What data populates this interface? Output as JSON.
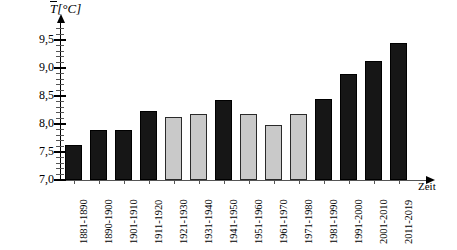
{
  "chart_data": {
    "type": "bar",
    "title": "",
    "ylabel": "T̄[°C]",
    "ylabel_symbol": "T",
    "ylabel_unit": "[°C]",
    "xlabel": "Zeit",
    "ylim": [
      7.0,
      9.75
    ],
    "ytick_values": [
      7.0,
      7.5,
      8.0,
      8.5,
      9.0,
      9.5
    ],
    "ytick_labels": [
      "7,0",
      "7,5",
      "8,0",
      "8,5",
      "9,0",
      "9,5"
    ],
    "ytick_minor_step": 0.1,
    "grid": false,
    "legend": "none",
    "categories": [
      "1881-1890",
      "1890-1900",
      "1901-1910",
      "1911-1920",
      "1921-1930",
      "1931-1940",
      "1941-1950",
      "1951-1960",
      "1961-1970",
      "1971-1980",
      "1981-1990",
      "1991-2000",
      "2001-2010",
      "2011-2019"
    ],
    "values": [
      7.63,
      7.9,
      7.9,
      8.23,
      8.12,
      8.18,
      8.43,
      8.18,
      7.98,
      8.18,
      8.45,
      8.9,
      9.13,
      9.45
    ],
    "bar_colors": [
      "black",
      "black",
      "black",
      "black",
      "gray",
      "gray",
      "black",
      "gray",
      "gray",
      "gray",
      "black",
      "black",
      "black",
      "black"
    ],
    "color_black": "#161616",
    "color_gray": "#c9c9c9",
    "axis_color": "#000000"
  }
}
